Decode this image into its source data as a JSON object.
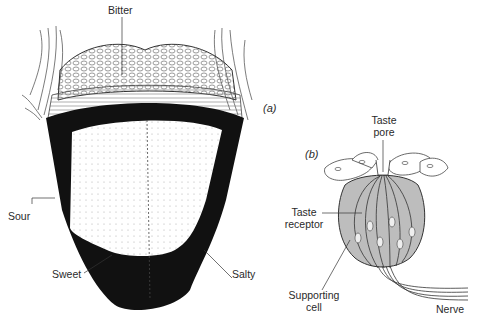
{
  "figure": {
    "panel_a": {
      "tag": "(a)",
      "subject": "tongue",
      "labels": {
        "bitter": "Bitter",
        "sour": "Sour",
        "sweet": "Sweet",
        "salty": "Salty"
      }
    },
    "panel_b": {
      "tag": "(b)",
      "subject": "taste bud",
      "labels": {
        "taste_pore_line1": "Taste",
        "taste_pore_line2": "pore",
        "taste_receptor_line1": "Taste",
        "taste_receptor_line2": "receptor",
        "supporting_cell_line1": "Supporting",
        "supporting_cell_line2": "cell",
        "nerve": "Nerve"
      }
    },
    "colors": {
      "ink": "#111111",
      "background": "#ffffff",
      "shading": "#9a9a9a"
    }
  }
}
